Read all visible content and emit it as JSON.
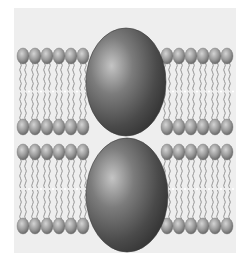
{
  "diagram": {
    "colors": {
      "background": "#eeeeee",
      "head_light": "#c8c8c8",
      "head_dark": "#7a7a7a",
      "tail": "#8a8a8a",
      "protein_light": "#b8b8b8",
      "protein_dark": "#3a3a3a"
    },
    "membranes": [
      {
        "name": "upper-bilayer",
        "outer_head_y": 56,
        "inner_head_y": 127,
        "left_heads": 6,
        "right_heads": 6,
        "protein": {
          "name": "upper-protein",
          "cx": 126,
          "cy": 82,
          "rx": 40,
          "ry": 54
        }
      },
      {
        "name": "lower-bilayer",
        "outer_head_y": 152,
        "inner_head_y": 226,
        "left_heads": 6,
        "right_heads": 6,
        "protein": {
          "name": "lower-protein",
          "cx": 127,
          "cy": 195,
          "rx": 41,
          "ry": 57
        }
      }
    ]
  }
}
